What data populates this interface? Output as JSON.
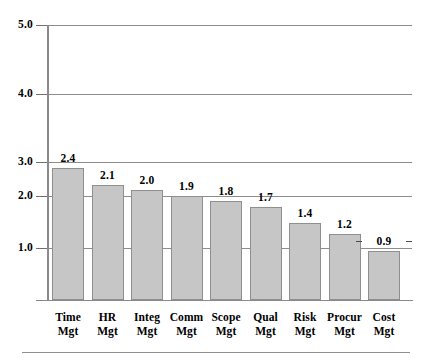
{
  "chart_data": {
    "type": "bar",
    "title": "",
    "subtitle": "",
    "xlabel": "",
    "ylabel": "",
    "categories": [
      "Time Mgt",
      "HR Mgt",
      "Integ Mgt",
      "Comm Mgt",
      "Scope Mgt",
      "Qual Mgt",
      "Risk Mgt",
      "Procur Mgt",
      "Cost Mgt"
    ],
    "category_lines": [
      [
        "Time",
        "Mgt"
      ],
      [
        "HR",
        "Mgt"
      ],
      [
        "Integ",
        "Mgt"
      ],
      [
        "Comm",
        "Mgt"
      ],
      [
        "Scope",
        "Mgt"
      ],
      [
        "Qual",
        "Mgt"
      ],
      [
        "Risk",
        "Mgt"
      ],
      [
        "Procur",
        "Mgt"
      ],
      [
        "Cost",
        "Mgt"
      ]
    ],
    "values": [
      2.4,
      2.1,
      2.0,
      1.9,
      1.8,
      1.7,
      1.4,
      1.2,
      0.9
    ],
    "value_labels": [
      "2.4",
      "2.1",
      "2.0",
      "1.9",
      "1.8",
      "1.7",
      "1.4",
      "1.2",
      "0.9"
    ],
    "ylim": [
      0,
      5
    ],
    "yticks": [
      1.0,
      2.0,
      3.0,
      4.0,
      5.0
    ],
    "ytick_labels": [
      "1.0",
      "2.0",
      "3.0",
      "4.0",
      "5.0"
    ],
    "grid": true,
    "grid_axis": "y",
    "legend": false,
    "legend_position": "none",
    "bar_fill_color": "#c6c6c6",
    "bar_border_color": "#8f8f8f",
    "axis_color": "#8a8a8a",
    "grid_color": "#8d8d8d",
    "text_color": "#000000"
  }
}
